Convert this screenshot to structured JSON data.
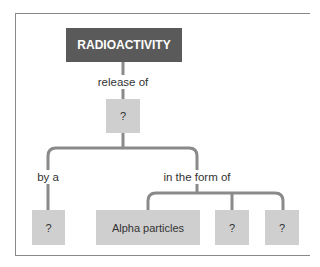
{
  "diagram": {
    "root": {
      "label": "RADIOACTIVITY",
      "color": "#5a5a5a"
    },
    "link_root": "release of",
    "node_release": {
      "label": "?"
    },
    "link_left": "by a",
    "node_left": {
      "label": "?"
    },
    "link_right": "in the form of",
    "forms": [
      {
        "label": "Alpha particles"
      },
      {
        "label": "?"
      },
      {
        "label": "?"
      }
    ],
    "box_color": "#cfcfcf",
    "line_color": "#8a8a8a"
  }
}
